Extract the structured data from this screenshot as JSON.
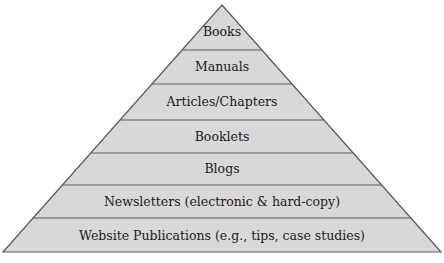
{
  "diagram": {
    "type": "pyramid",
    "colors": {
      "fill": "#d8d8d8",
      "stroke": "#5a5a5a",
      "text": "#1a1a1a",
      "background": "#ffffff"
    },
    "tiers": [
      {
        "label": "Books"
      },
      {
        "label": "Manuals"
      },
      {
        "label": "Articles/Chapters"
      },
      {
        "label": "Booklets"
      },
      {
        "label": "Blogs"
      },
      {
        "label": "Newsletters (electronic & hard-copy)"
      },
      {
        "label": "Website Publications (e.g., tips, case studies)"
      }
    ]
  }
}
